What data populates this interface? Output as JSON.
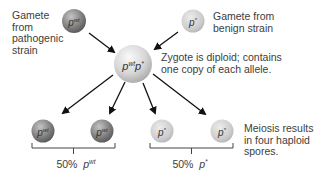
{
  "figure": {
    "type": "genetics-cross-diagram",
    "labels": {
      "gamete_pathogenic": "Gamete\nfrom\npathogenic\nstrain",
      "gamete_benign": "Gamete from\nbenign strain",
      "zygote_note": "Zygote is diploid; contains\none copy of each allele.",
      "meiosis_note": "Meiosis results\nin four haploid\nspores."
    },
    "gametes": [
      {
        "id": "pathogenic",
        "allele_base": "p",
        "allele_sup": "wt",
        "color": "#7d7d7d"
      },
      {
        "id": "benign",
        "allele_base": "p",
        "allele_sup": "*",
        "color": "#cfcfcf"
      }
    ],
    "zygote": {
      "allele_base1": "p",
      "allele_sup1": "wt",
      "allele_base2": "p",
      "allele_sup2": "*",
      "color": "#dcdcdc"
    },
    "spores": [
      {
        "allele_base": "p",
        "allele_sup": "wt",
        "color": "#7d7d7d"
      },
      {
        "allele_base": "p",
        "allele_sup": "wt",
        "color": "#7d7d7d"
      },
      {
        "allele_base": "p",
        "allele_sup": "*",
        "color": "#cfcfcf"
      },
      {
        "allele_base": "p",
        "allele_sup": "*",
        "color": "#cfcfcf"
      }
    ],
    "groups": [
      {
        "percent": "50%",
        "allele_base": "p",
        "allele_sup": "wt"
      },
      {
        "percent": "50%",
        "allele_base": "p",
        "allele_sup": "*"
      }
    ]
  }
}
